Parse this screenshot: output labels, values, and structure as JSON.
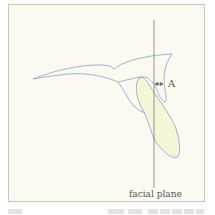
{
  "diagram": {
    "labels": {
      "distance": "A",
      "plane": "facial plane"
    },
    "colors": {
      "background": "#fcfaf0",
      "upper_outline": "#8aa0c8",
      "lower_fill": "#f6f6d6",
      "lower_outline": "#8aa0c8",
      "plane_line": "#7a7a7a",
      "arrow": "#666666"
    },
    "shapes": [
      {
        "name": "upper-jaw-outline",
        "type": "outline"
      },
      {
        "name": "lower-lens-shape",
        "type": "filled"
      },
      {
        "name": "facial-plane-line",
        "type": "vertical-line"
      },
      {
        "name": "distance-arrow",
        "type": "double-arrow"
      }
    ]
  }
}
